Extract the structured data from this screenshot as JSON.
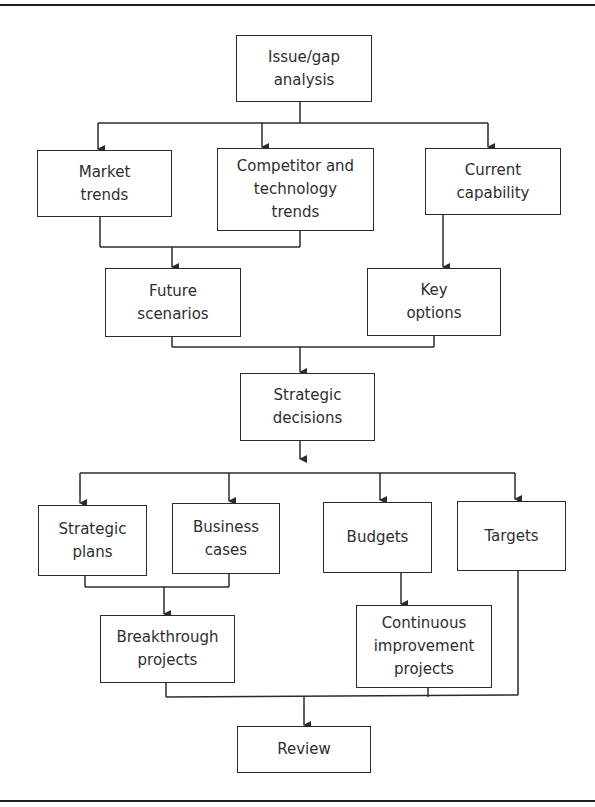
{
  "figure": {
    "title_fragment": "",
    "nodes": {
      "issue_gap": "Issue/gap\nanalysis",
      "market_trends": "Market\ntrends",
      "competitor_tech": "Competitor and\ntechnology\ntrends",
      "current_capability": "Current\ncapability",
      "future_scenarios": "Future\nscenarios",
      "key_options": "Key\noptions",
      "strategic_decisions": "Strategic\ndecisions",
      "strategic_plans": "Strategic\nplans",
      "business_cases": "Business\ncases",
      "budgets": "Budgets",
      "targets": "Targets",
      "breakthrough_projects": "Breakthrough\nprojects",
      "continuous_improvement": "Continuous\nimprovement\nprojects",
      "review": "Review"
    },
    "edges": [
      {
        "from": "issue_gap",
        "to": "market_trends"
      },
      {
        "from": "issue_gap",
        "to": "competitor_tech"
      },
      {
        "from": "issue_gap",
        "to": "current_capability"
      },
      {
        "from": "market_trends",
        "to": "future_scenarios"
      },
      {
        "from": "competitor_tech",
        "to": "future_scenarios"
      },
      {
        "from": "current_capability",
        "to": "key_options"
      },
      {
        "from": "future_scenarios",
        "to": "strategic_decisions"
      },
      {
        "from": "key_options",
        "to": "strategic_decisions"
      },
      {
        "from": "strategic_decisions",
        "to": "strategic_plans"
      },
      {
        "from": "strategic_decisions",
        "to": "business_cases"
      },
      {
        "from": "strategic_decisions",
        "to": "budgets"
      },
      {
        "from": "strategic_decisions",
        "to": "targets"
      },
      {
        "from": "strategic_plans",
        "to": "breakthrough_projects"
      },
      {
        "from": "business_cases",
        "to": "breakthrough_projects"
      },
      {
        "from": "budgets",
        "to": "continuous_improvement"
      },
      {
        "from": "breakthrough_projects",
        "to": "review"
      },
      {
        "from": "continuous_improvement",
        "to": "review"
      },
      {
        "from": "targets",
        "to": "review"
      }
    ],
    "colors": {
      "line": "#2b2b2b",
      "text": "#2e2e2e",
      "background": "#ffffff"
    }
  }
}
